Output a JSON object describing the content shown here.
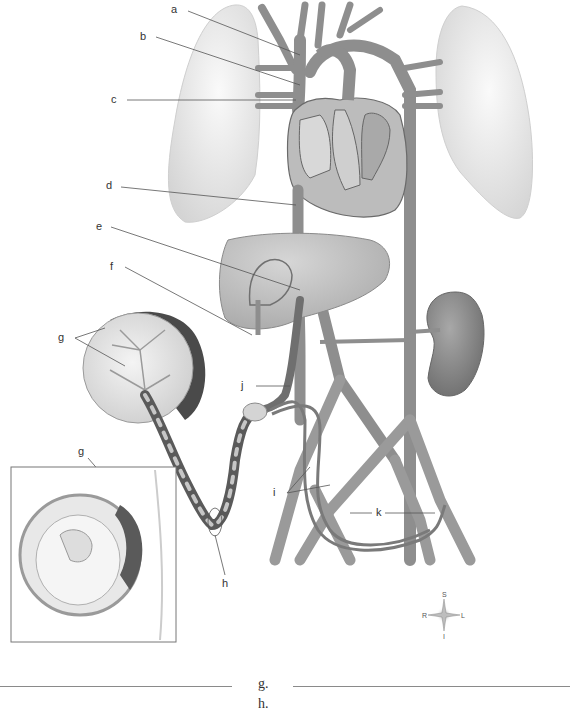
{
  "diagram": {
    "labels": [
      {
        "id": "a",
        "text": "a"
      },
      {
        "id": "b",
        "text": "b"
      },
      {
        "id": "c",
        "text": "c"
      },
      {
        "id": "d",
        "text": "d"
      },
      {
        "id": "e",
        "text": "e"
      },
      {
        "id": "f",
        "text": "f"
      },
      {
        "id": "g1",
        "text": "g"
      },
      {
        "id": "g2",
        "text": "g"
      },
      {
        "id": "h",
        "text": "h"
      },
      {
        "id": "i",
        "text": "i"
      },
      {
        "id": "j",
        "text": "j"
      },
      {
        "id": "k",
        "text": "k"
      }
    ],
    "compass": {
      "superior": "S",
      "inferior": "I",
      "right": "R",
      "left": "L"
    },
    "colors": {
      "vessel": "#9a9a9a",
      "vessel_dark": "#6e6e6e",
      "organ_light": "#e6e6e6",
      "liver": "#bdbdbd",
      "kidney": "#8c8c8c",
      "placenta_dark": "#4a4a4a",
      "leader": "#555555"
    }
  },
  "answers": {
    "items": [
      {
        "label": "g."
      },
      {
        "label": "h."
      }
    ]
  }
}
